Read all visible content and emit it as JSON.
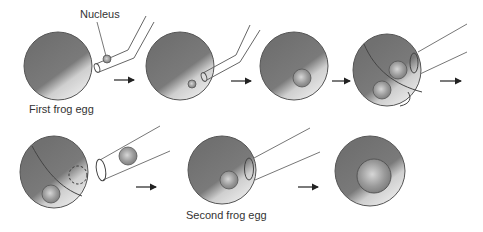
{
  "diagram": {
    "labels": {
      "nucleus": "Nucleus",
      "first_egg": "First frog egg",
      "second_egg": "Second frog egg"
    },
    "steps": [
      {
        "id": 1,
        "description": "Nucleus drawn into pipette from first frog egg"
      },
      {
        "id": 2,
        "description": "Nucleus injected into egg"
      },
      {
        "id": 3,
        "description": "Egg with transplanted nucleus"
      },
      {
        "id": 4,
        "description": "Egg cut open, nucleus removed by pipette"
      },
      {
        "id": 5,
        "description": "Nucleus held in pipette, empty region in egg"
      },
      {
        "id": 6,
        "description": "Nucleus injected into second frog egg"
      },
      {
        "id": 7,
        "description": "Second frog egg with enlarged nucleus"
      }
    ],
    "colors": {
      "egg_dark": "#6f6f6f",
      "egg_light": "#dcdcdc",
      "outline": "#555555",
      "nucleus": "#9a9a9a"
    }
  }
}
